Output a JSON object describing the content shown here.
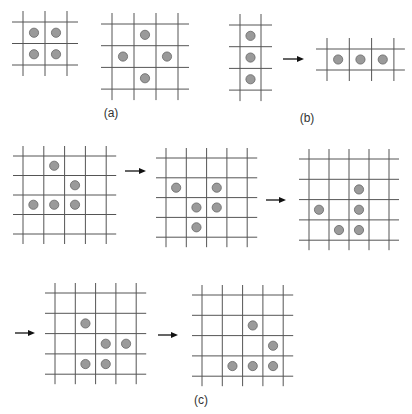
{
  "figure": {
    "panels": [
      {
        "id": "a",
        "label": "(a)"
      },
      {
        "id": "b",
        "label": "(b)"
      },
      {
        "id": "c",
        "label": "(c)"
      }
    ],
    "colors": {
      "grid_line": "#555555",
      "dot_fill": "#9a9a9a",
      "dot_stroke": "#666666",
      "arrow": "#111111",
      "label": "#333333"
    },
    "grids": [
      {
        "name": "a1",
        "panel": "a",
        "cols": 2,
        "rows": 2,
        "occupied": [
          [
            0,
            0
          ],
          [
            1,
            0
          ],
          [
            0,
            1
          ],
          [
            1,
            1
          ]
        ]
      },
      {
        "name": "a2",
        "panel": "a",
        "cols": 3,
        "rows": 3,
        "occupied": [
          [
            1,
            0
          ],
          [
            0,
            1
          ],
          [
            2,
            1
          ],
          [
            1,
            2
          ]
        ]
      },
      {
        "name": "b1",
        "panel": "b",
        "cols": 1,
        "rows": 3,
        "occupied": [
          [
            0,
            0
          ],
          [
            0,
            1
          ],
          [
            0,
            2
          ]
        ]
      },
      {
        "name": "b2",
        "panel": "b",
        "cols": 3,
        "rows": 1,
        "occupied": [
          [
            0,
            0
          ],
          [
            1,
            0
          ],
          [
            2,
            0
          ]
        ]
      },
      {
        "name": "c1",
        "panel": "c",
        "cols": 4,
        "rows": 4,
        "occupied": [
          [
            1,
            0
          ],
          [
            2,
            1
          ],
          [
            0,
            2
          ],
          [
            1,
            2
          ],
          [
            2,
            2
          ]
        ]
      },
      {
        "name": "c2",
        "panel": "c",
        "cols": 4,
        "rows": 4,
        "occupied": [
          [
            0,
            1
          ],
          [
            2,
            1
          ],
          [
            1,
            2
          ],
          [
            2,
            2
          ],
          [
            1,
            3
          ]
        ]
      },
      {
        "name": "c3",
        "panel": "c",
        "cols": 4,
        "rows": 4,
        "occupied": [
          [
            2,
            1
          ],
          [
            0,
            2
          ],
          [
            2,
            2
          ],
          [
            1,
            3
          ],
          [
            2,
            3
          ]
        ]
      },
      {
        "name": "c4",
        "panel": "c",
        "cols": 4,
        "rows": 4,
        "occupied": [
          [
            1,
            1
          ],
          [
            2,
            2
          ],
          [
            3,
            2
          ],
          [
            1,
            3
          ],
          [
            2,
            3
          ]
        ]
      },
      {
        "name": "c5",
        "panel": "c",
        "cols": 4,
        "rows": 4,
        "occupied": [
          [
            2,
            1
          ],
          [
            3,
            2
          ],
          [
            1,
            3
          ],
          [
            2,
            3
          ],
          [
            3,
            3
          ]
        ]
      }
    ],
    "transitions": [
      {
        "from": "b1",
        "to": "b2"
      },
      {
        "from": "c1",
        "to": "c2"
      },
      {
        "from": "c2",
        "to": "c3"
      },
      {
        "from": "c3",
        "to": "c4"
      },
      {
        "from": "c4",
        "to": "c5"
      }
    ]
  }
}
